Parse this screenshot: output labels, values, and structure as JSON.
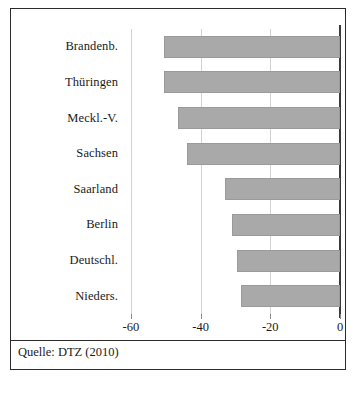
{
  "chart_data": {
    "type": "bar",
    "orientation": "horizontal",
    "title": "",
    "subtitle": "",
    "xlabel": "",
    "ylabel": "",
    "categories": [
      "Brandenb.",
      "Thüringen",
      "Meckl.-V.",
      "Sachsen",
      "Saarland",
      "Berlin",
      "Deutschl.",
      "Nieders."
    ],
    "values": [
      -50.5,
      -50.5,
      -46.5,
      -44.0,
      -33.0,
      -31.0,
      -29.5,
      -28.5
    ],
    "series": [
      {
        "name": "",
        "values": [
          -50.5,
          -50.5,
          -46.5,
          -44.0,
          -33.0,
          -31.0,
          -29.5,
          -28.5
        ]
      }
    ],
    "xlim": [
      -70,
      0
    ],
    "xticks": [
      -60,
      -40,
      -20,
      0
    ],
    "xtick_labels": [
      "-60",
      "-40",
      "-20",
      "0"
    ],
    "grid": true,
    "grid_axis": "x",
    "legend": false,
    "legend_position": "none",
    "bar_color": "#a9a9a9",
    "axis_color": "#3a3a3a",
    "gridline_color": "#d2d2d2"
  },
  "source": {
    "text": "Quelle: DTZ (2010)"
  },
  "caption": {
    "text": ""
  }
}
